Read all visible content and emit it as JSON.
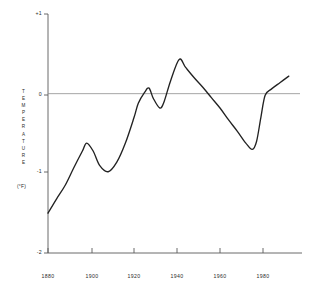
{
  "chart_data": {
    "type": "line",
    "title": "",
    "subtitle": "",
    "xlabel": "",
    "ylabel": "TEMPERATURE",
    "ylabel_unit": "(°F)",
    "xlim": [
      1878,
      1994
    ],
    "ylim": [
      -2,
      1
    ],
    "grid": false,
    "legend": null,
    "zero_reference_line": 0,
    "x_ticks": [
      1880,
      1900,
      1920,
      1940,
      1960,
      1980
    ],
    "x_tick_labels": [
      "1880",
      "1900",
      "1920",
      "1940",
      "1960",
      "1980"
    ],
    "y_ticks": [
      1,
      0,
      -1,
      -2
    ],
    "y_tick_labels": [
      "+1",
      "0",
      "-1",
      "-2"
    ],
    "series": [
      {
        "name": "Global temperature anomaly",
        "color": "#222222",
        "x": [
          1880,
          1884,
          1888,
          1892,
          1896,
          1898,
          1901,
          1904,
          1908,
          1912,
          1916,
          1920,
          1922,
          1925,
          1927,
          1929,
          1932,
          1934,
          1937,
          1941,
          1944,
          1948,
          1952,
          1956,
          1960,
          1964,
          1968,
          1972,
          1975,
          1977,
          1979,
          1981,
          1984,
          1988,
          1992
        ],
        "y": [
          -1.5,
          -1.32,
          -1.15,
          -0.93,
          -0.72,
          -0.62,
          -0.72,
          -0.9,
          -0.98,
          -0.86,
          -0.62,
          -0.3,
          -0.12,
          0.02,
          0.07,
          -0.06,
          -0.18,
          -0.1,
          0.16,
          0.43,
          0.33,
          0.2,
          0.08,
          -0.05,
          -0.18,
          -0.33,
          -0.47,
          -0.62,
          -0.7,
          -0.6,
          -0.3,
          -0.02,
          0.06,
          0.14,
          0.22
        ]
      }
    ]
  },
  "axis": {
    "y_label_plus_one": "+1",
    "y_label_zero": "0",
    "y_label_minus_one": "-1",
    "y_label_minus_two": "-2",
    "x_label_1880": "1880",
    "x_label_1900": "1900",
    "x_label_1920": "1920",
    "x_label_1940": "1940",
    "x_label_1960": "1960",
    "x_label_1980": "1980",
    "vertical_title": "TEMPERATURE",
    "unit": "(°F)"
  },
  "colors": {
    "background": "#ffffff",
    "axis": "#555555",
    "curve": "#222222",
    "zero_line": "#888888",
    "text": "#2b2b2b"
  }
}
